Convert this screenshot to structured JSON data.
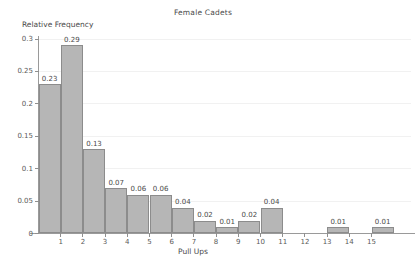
{
  "chart_data": {
    "type": "bar",
    "title": "Female Cadets",
    "xlabel": "Pull Ups",
    "ylabel": "Relative Frequency",
    "grid": true,
    "legend": null,
    "xlim": [
      0,
      16.4
    ],
    "ylim": [
      0,
      0.3
    ],
    "xticks": [
      "1",
      "2",
      "3",
      "4",
      "5",
      "6",
      "7",
      "8",
      "9",
      "10",
      "11",
      "12",
      "13",
      "14",
      "15"
    ],
    "xtick_values": [
      1,
      2,
      3,
      4,
      5,
      6,
      7,
      8,
      9,
      10,
      11,
      12,
      13,
      14,
      15
    ],
    "yticks": [
      "0",
      "0.05",
      "0.1",
      "0.15",
      "0.2",
      "0.25",
      "0.3"
    ],
    "ytick_values": [
      0,
      0.05,
      0.1,
      0.15,
      0.2,
      0.25,
      0.3
    ],
    "bin_width": 1,
    "categories": [
      "0-1",
      "1-2",
      "2-3",
      "3-4",
      "4-5",
      "5-6",
      "6-7",
      "7-8",
      "8-9",
      "9-10",
      "10-11",
      "13-14",
      "15-16"
    ],
    "bins": [
      {
        "start": 0,
        "end": 1,
        "value": 0.23,
        "label": "0.23"
      },
      {
        "start": 1,
        "end": 2,
        "value": 0.29,
        "label": "0.29"
      },
      {
        "start": 2,
        "end": 3,
        "value": 0.13,
        "label": "0.13"
      },
      {
        "start": 3,
        "end": 4,
        "value": 0.07,
        "label": "0.07"
      },
      {
        "start": 4,
        "end": 5,
        "value": 0.06,
        "label": "0.06"
      },
      {
        "start": 5,
        "end": 6,
        "value": 0.06,
        "label": "0.06"
      },
      {
        "start": 6,
        "end": 7,
        "value": 0.04,
        "label": "0.04"
      },
      {
        "start": 7,
        "end": 8,
        "value": 0.02,
        "label": "0.02"
      },
      {
        "start": 8,
        "end": 9,
        "value": 0.01,
        "label": "0.01"
      },
      {
        "start": 9,
        "end": 10,
        "value": 0.02,
        "label": "0.02"
      },
      {
        "start": 10,
        "end": 11,
        "value": 0.04,
        "label": "0.04"
      },
      {
        "start": 13,
        "end": 14,
        "value": 0.01,
        "label": "0.01"
      },
      {
        "start": 15,
        "end": 16,
        "value": 0.01,
        "label": "0.01"
      }
    ],
    "values": [
      0.23,
      0.29,
      0.13,
      0.07,
      0.06,
      0.06,
      0.04,
      0.02,
      0.01,
      0.02,
      0.04,
      0.01,
      0.01
    ],
    "colors": {
      "bar_fill": "#b6b6b6",
      "bar_edge": "#8c8c8c",
      "axis": "#9a9a9a",
      "grid": "#f1f1f1",
      "text": "#4a4a4a",
      "background": "#ffffff"
    }
  }
}
